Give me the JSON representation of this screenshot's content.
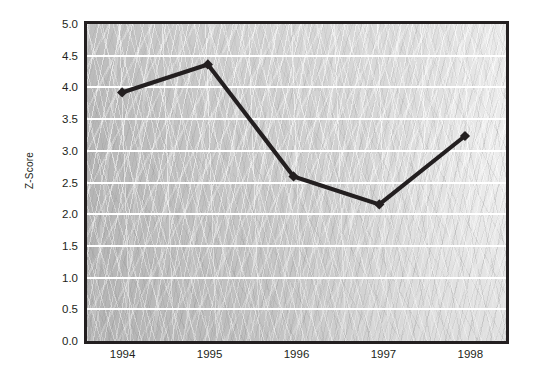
{
  "chart_data": {
    "type": "line",
    "title": "",
    "subtitle": "",
    "xlabel": "",
    "ylabel": "Z-Score",
    "categories": [
      "1994",
      "1995",
      "1996",
      "1997",
      "1998"
    ],
    "x": [
      1994,
      1995,
      1996,
      1997,
      1998
    ],
    "values": [
      3.9,
      4.35,
      2.55,
      2.1,
      3.2
    ],
    "series": [
      {
        "name": "Z-Score",
        "values": [
          3.9,
          4.35,
          2.55,
          2.1,
          3.2
        ]
      }
    ],
    "ylim": [
      0.0,
      5.0
    ],
    "ytick_labels": [
      "0.0",
      "0.5",
      "1.0",
      "1.5",
      "2.0",
      "2.5",
      "3.0",
      "3.5",
      "4.0",
      "4.5",
      "5.0"
    ],
    "ytick_values": [
      0.0,
      0.5,
      1.0,
      1.5,
      2.0,
      2.5,
      3.0,
      3.5,
      4.0,
      4.5,
      5.0
    ],
    "xtick_labels": [
      "1994",
      "1995",
      "1996",
      "1997",
      "1998"
    ],
    "grid": "horizontal",
    "gridline_color": "#ffffff",
    "legend": "none",
    "marker": "diamond",
    "marker_color": "#231f20",
    "line_color": "#231f20",
    "plot_background_color": "#c6c6c6",
    "plot_border_color": "#231f20",
    "figure_background_color": "#ffffff",
    "annotations": []
  }
}
